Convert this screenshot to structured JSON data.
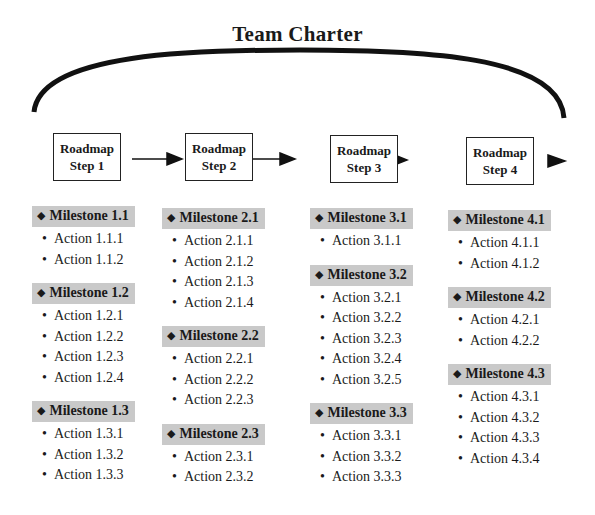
{
  "title": "Team Charter",
  "steps": [
    {
      "line1": "Roadmap",
      "line2": "Step 1"
    },
    {
      "line1": "Roadmap",
      "line2": "Step 2"
    },
    {
      "line1": "Roadmap",
      "line2": "Step 3"
    },
    {
      "line1": "Roadmap",
      "line2": "Step 4"
    }
  ],
  "columns": [
    {
      "milestones": [
        {
          "label": "Milestone 1.1",
          "actions": [
            "Action 1.1.1",
            "Action 1.1.2"
          ]
        },
        {
          "label": "Milestone 1.2",
          "actions": [
            "Action 1.2.1",
            "Action 1.2.2",
            "Action 1.2.3",
            "Action 1.2.4"
          ]
        },
        {
          "label": "Milestone 1.3",
          "actions": [
            "Action 1.3.1",
            "Action 1.3.2",
            "Action 1.3.3"
          ]
        }
      ]
    },
    {
      "milestones": [
        {
          "label": "Milestone 2.1",
          "actions": [
            "Action 2.1.1",
            "Action 2.1.2",
            "Action 2.1.3",
            "Action 2.1.4"
          ]
        },
        {
          "label": "Milestone 2.2",
          "actions": [
            "Action 2.2.1",
            "Action 2.2.2",
            "Action 2.2.3"
          ]
        },
        {
          "label": "Milestone 2.3",
          "actions": [
            "Action 2.3.1",
            "Action 2.3.2"
          ]
        }
      ]
    },
    {
      "milestones": [
        {
          "label": "Milestone 3.1",
          "actions": [
            "Action 3.1.1"
          ]
        },
        {
          "label": "Milestone 3.2",
          "actions": [
            "Action 3.2.1",
            "Action 3.2.2",
            "Action 3.2.3",
            "Action 3.2.4",
            "Action 3.2.5"
          ]
        },
        {
          "label": "Milestone 3.3",
          "actions": [
            "Action 3.3.1",
            "Action 3.3.2",
            "Action 3.3.3"
          ]
        }
      ]
    },
    {
      "milestones": [
        {
          "label": "Milestone 4.1",
          "actions": [
            "Action 4.1.1",
            "Action 4.1.2"
          ]
        },
        {
          "label": "Milestone 4.2",
          "actions": [
            "Action 4.2.1",
            "Action 4.2.2"
          ]
        },
        {
          "label": "Milestone 4.3",
          "actions": [
            "Action 4.3.1",
            "Action 4.3.2",
            "Action 4.3.3",
            "Action 4.3.4"
          ]
        }
      ]
    }
  ],
  "symbols": {
    "milestone_icon": "diamond-icon",
    "action_icon": "bullet-icon"
  }
}
